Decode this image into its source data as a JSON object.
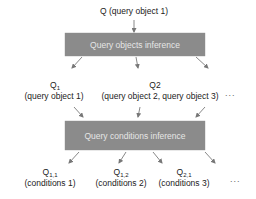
{
  "diagram": {
    "top_input": "Q (query object 1)",
    "box1_label": "Query objects inference",
    "box2_label": "Query conditions inference",
    "level1": [
      {
        "name": "Q",
        "sub": "1",
        "desc": "(query object 1)"
      },
      {
        "name": "Q2",
        "sub": "",
        "desc": "(query object 2, query object 3)"
      }
    ],
    "level2": [
      {
        "name": "Q",
        "sub": "1,1",
        "desc": "(conditions 1)"
      },
      {
        "name": "Q",
        "sub": "1,2",
        "desc": "(conditions 2)"
      },
      {
        "name": "Q",
        "sub": "2,1",
        "desc": "(conditions 3)"
      }
    ],
    "ellipsis": "...",
    "colors": {
      "box_fill": "#8b8b8b",
      "box_text": "#e6e6e6",
      "arrow": "#777777"
    }
  }
}
